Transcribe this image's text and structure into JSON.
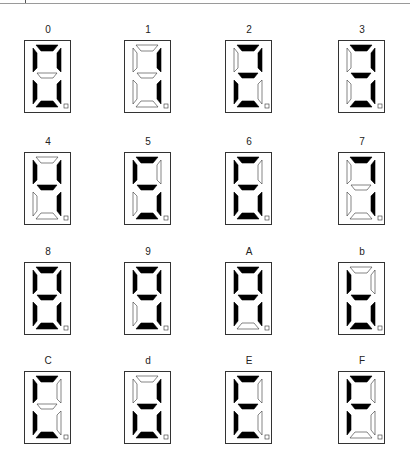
{
  "segment_order": [
    "a",
    "b",
    "c",
    "d",
    "e",
    "f",
    "g"
  ],
  "colors": {
    "segment_on": "#000000",
    "segment_off": "#ffffff",
    "outline": "#333333"
  },
  "digits": [
    {
      "label": "0",
      "segments": [
        1,
        1,
        1,
        1,
        1,
        1,
        0
      ]
    },
    {
      "label": "1",
      "segments": [
        0,
        1,
        1,
        0,
        0,
        0,
        0
      ]
    },
    {
      "label": "2",
      "segments": [
        1,
        1,
        0,
        1,
        1,
        0,
        1
      ]
    },
    {
      "label": "3",
      "segments": [
        1,
        1,
        1,
        1,
        0,
        0,
        1
      ]
    },
    {
      "label": "4",
      "segments": [
        0,
        1,
        1,
        0,
        0,
        1,
        1
      ]
    },
    {
      "label": "5",
      "segments": [
        1,
        0,
        1,
        1,
        0,
        1,
        1
      ]
    },
    {
      "label": "6",
      "segments": [
        1,
        0,
        1,
        1,
        1,
        1,
        1
      ]
    },
    {
      "label": "7",
      "segments": [
        1,
        1,
        1,
        0,
        0,
        0,
        0
      ]
    },
    {
      "label": "8",
      "segments": [
        1,
        1,
        1,
        1,
        1,
        1,
        1
      ]
    },
    {
      "label": "9",
      "segments": [
        1,
        1,
        1,
        1,
        0,
        1,
        1
      ]
    },
    {
      "label": "A",
      "segments": [
        1,
        1,
        1,
        0,
        1,
        1,
        1
      ]
    },
    {
      "label": "b",
      "segments": [
        0,
        0,
        1,
        1,
        1,
        1,
        1
      ]
    },
    {
      "label": "C",
      "segments": [
        1,
        0,
        0,
        1,
        1,
        1,
        0
      ]
    },
    {
      "label": "d",
      "segments": [
        0,
        1,
        1,
        1,
        1,
        0,
        1
      ]
    },
    {
      "label": "E",
      "segments": [
        1,
        0,
        0,
        1,
        1,
        1,
        1
      ]
    },
    {
      "label": "F",
      "segments": [
        1,
        0,
        0,
        0,
        1,
        1,
        1
      ]
    }
  ]
}
